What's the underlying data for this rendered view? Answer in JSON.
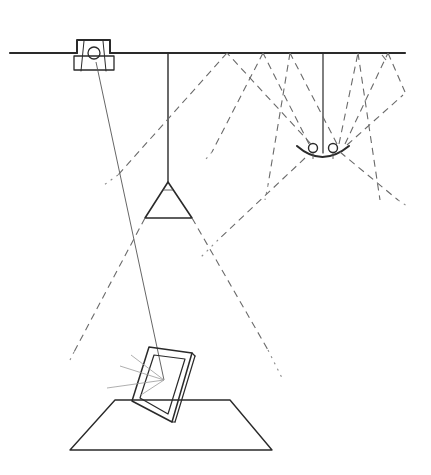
{
  "diagram": {
    "title": "",
    "colors": {
      "background": "#ffffff",
      "line": "#2a2a2a",
      "dashed_beam": "#6a6a6a",
      "faint": "#9a9a9a"
    },
    "elements": [
      {
        "id": "ceiling",
        "label": "ceiling line"
      },
      {
        "id": "spotlight",
        "label": "recessed spotlight"
      },
      {
        "id": "spot-beam",
        "label": "spotlight beam to frame"
      },
      {
        "id": "pendant",
        "label": "pendant cone lamp"
      },
      {
        "id": "twin-fixture",
        "label": "twin-bulb fixture with reflector"
      },
      {
        "id": "frame",
        "label": "tilted picture frame"
      },
      {
        "id": "table",
        "label": "table surface"
      },
      {
        "id": "reflections",
        "label": "reflected rays"
      }
    ]
  }
}
